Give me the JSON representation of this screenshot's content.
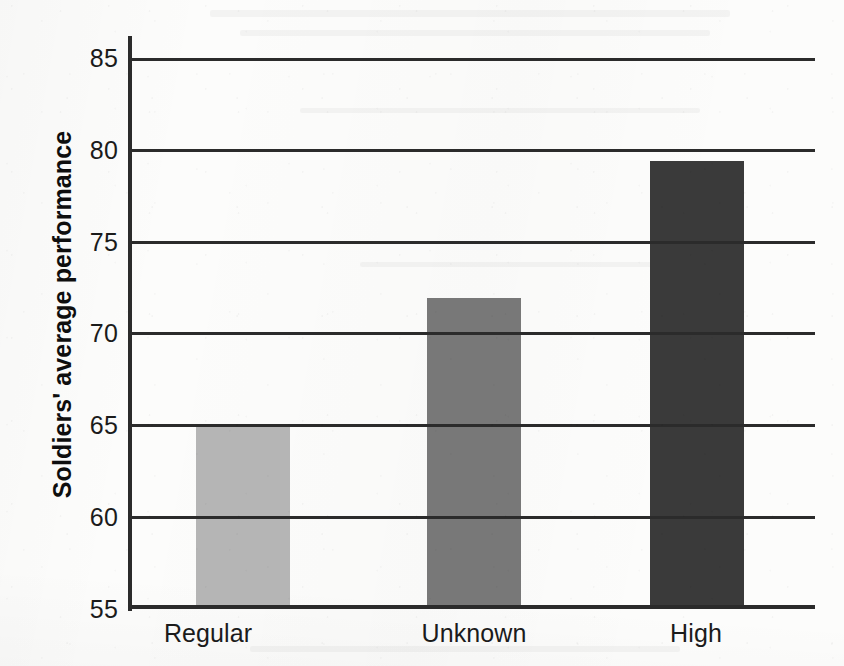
{
  "figure": {
    "kind": "scanned-bar-chart",
    "background_color": "#fcfcfb",
    "ink_color": "#2b2b2b"
  },
  "chart_data": {
    "type": "bar",
    "title": "",
    "subtitle": "",
    "xlabel": "",
    "ylabel": "Soldiers' average performance",
    "categories": [
      "Regular",
      "Unknown",
      "High"
    ],
    "values": [
      65.0,
      71.9,
      79.4
    ],
    "series": [
      {
        "name": "Soldiers' average performance",
        "values": [
          65.0,
          71.9,
          79.4
        ]
      }
    ],
    "bar_colors": [
      "#b5b5b5",
      "#787878",
      "#3a3a3a"
    ],
    "ylim": [
      55,
      85
    ],
    "yticks": [
      85,
      80,
      75,
      70,
      65,
      60,
      55
    ],
    "ytick_labels": [
      "85",
      "80",
      "75",
      "70",
      "65",
      "60",
      "55"
    ],
    "xtick_labels": [
      "Regular",
      "Unknown",
      "High"
    ],
    "grid": true,
    "grid_axis": "y",
    "legend": false,
    "legend_position": "none",
    "annotations": []
  },
  "axes": {
    "y_title": "Soldiers' average performance",
    "y_ticks": [
      {
        "label": "85",
        "value": 85
      },
      {
        "label": "80",
        "value": 80
      },
      {
        "label": "75",
        "value": 75
      },
      {
        "label": "70",
        "value": 70
      },
      {
        "label": "65",
        "value": 65
      },
      {
        "label": "60",
        "value": 60
      },
      {
        "label": "55",
        "value": 55
      }
    ],
    "x_ticks": [
      {
        "label": "Regular"
      },
      {
        "label": "Unknown"
      },
      {
        "label": "High"
      }
    ]
  },
  "bars": [
    {
      "category": "Regular",
      "value": 65.0,
      "color": "#b5b5b5"
    },
    {
      "category": "Unknown",
      "value": 71.9,
      "color": "#787878"
    },
    {
      "category": "High",
      "value": 79.4,
      "color": "#3a3a3a"
    }
  ]
}
